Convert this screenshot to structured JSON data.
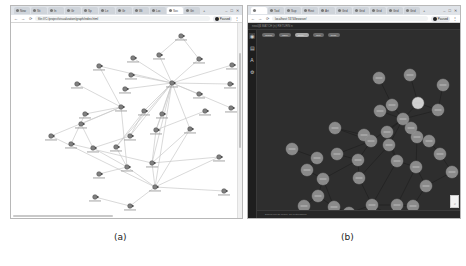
{
  "panel_a": {
    "caption": "(a)",
    "browser": {
      "tabs": [
        {
          "label": "New",
          "active": false
        },
        {
          "label": "Sti",
          "active": false
        },
        {
          "label": "In",
          "active": false
        },
        {
          "label": "Gr",
          "active": false
        },
        {
          "label": "Sp",
          "active": false
        },
        {
          "label": "Le",
          "active": false
        },
        {
          "label": "Gr",
          "active": false
        },
        {
          "label": "Wi",
          "active": false
        },
        {
          "label": "Loc",
          "active": false
        },
        {
          "label": "Soc",
          "active": true
        },
        {
          "label": "Gri",
          "active": false
        }
      ],
      "new_tab": "+",
      "window_controls": [
        "–",
        "□",
        "✕"
      ],
      "nav": {
        "back": "←",
        "forward": "→",
        "reload": "⟳"
      },
      "url": "file:///C:/project/visualization/graph/index.html",
      "profile_label": "Paused",
      "menu": "⋮"
    },
    "graph": {
      "theme": "light",
      "node_color": "#808080",
      "edge_color": "#c8c8c8",
      "nodes": [
        {
          "id": "n1",
          "x": 170,
          "y": 13
        },
        {
          "id": "n2",
          "x": 148,
          "y": 32
        },
        {
          "id": "n3",
          "x": 188,
          "y": 36
        },
        {
          "id": "n4",
          "x": 122,
          "y": 35
        },
        {
          "id": "n5",
          "x": 88,
          "y": 43
        },
        {
          "id": "n6",
          "x": 221,
          "y": 42
        },
        {
          "id": "n7",
          "x": 120,
          "y": 52
        },
        {
          "id": "n8",
          "x": 161,
          "y": 60
        },
        {
          "id": "n9",
          "x": 66,
          "y": 61
        },
        {
          "id": "n10",
          "x": 114,
          "y": 66
        },
        {
          "id": "n11",
          "x": 219,
          "y": 61
        },
        {
          "id": "n12",
          "x": 188,
          "y": 71
        },
        {
          "id": "n13",
          "x": 220,
          "y": 85
        },
        {
          "id": "n14",
          "x": 194,
          "y": 88
        },
        {
          "id": "n15",
          "x": 110,
          "y": 84
        },
        {
          "id": "n16",
          "x": 74,
          "y": 91
        },
        {
          "id": "n17",
          "x": 133,
          "y": 88
        },
        {
          "id": "n18",
          "x": 151,
          "y": 91
        },
        {
          "id": "n19",
          "x": 70,
          "y": 101
        },
        {
          "id": "n20",
          "x": 145,
          "y": 107
        },
        {
          "id": "n21",
          "x": 179,
          "y": 106
        },
        {
          "id": "n22",
          "x": 119,
          "y": 113
        },
        {
          "id": "n23",
          "x": 40,
          "y": 113
        },
        {
          "id": "n24",
          "x": 60,
          "y": 121
        },
        {
          "id": "n25",
          "x": 82,
          "y": 125
        },
        {
          "id": "n26",
          "x": 105,
          "y": 124
        },
        {
          "id": "n27",
          "x": 208,
          "y": 134
        },
        {
          "id": "n28",
          "x": 141,
          "y": 140
        },
        {
          "id": "n29",
          "x": 116,
          "y": 144
        },
        {
          "id": "n30",
          "x": 88,
          "y": 151
        },
        {
          "id": "n31",
          "x": 144,
          "y": 164
        },
        {
          "id": "n32",
          "x": 213,
          "y": 168
        },
        {
          "id": "n33",
          "x": 84,
          "y": 174
        },
        {
          "id": "n34",
          "x": 119,
          "y": 183
        }
      ],
      "edges": [
        [
          "n1",
          "n2"
        ],
        [
          "n1",
          "n3"
        ],
        [
          "n2",
          "n8"
        ],
        [
          "n3",
          "n8"
        ],
        [
          "n4",
          "n8"
        ],
        [
          "n5",
          "n15"
        ],
        [
          "n5",
          "n8"
        ],
        [
          "n6",
          "n8"
        ],
        [
          "n7",
          "n8"
        ],
        [
          "n8",
          "n11"
        ],
        [
          "n8",
          "n12"
        ],
        [
          "n8",
          "n13"
        ],
        [
          "n9",
          "n15"
        ],
        [
          "n10",
          "n8"
        ],
        [
          "n8",
          "n17"
        ],
        [
          "n8",
          "n18"
        ],
        [
          "n8",
          "n20"
        ],
        [
          "n8",
          "n21"
        ],
        [
          "n8",
          "n22"
        ],
        [
          "n8",
          "n28"
        ],
        [
          "n8",
          "n26"
        ],
        [
          "n8",
          "n31"
        ],
        [
          "n15",
          "n16"
        ],
        [
          "n15",
          "n19"
        ],
        [
          "n15",
          "n23"
        ],
        [
          "n15",
          "n29"
        ],
        [
          "n16",
          "n24"
        ],
        [
          "n19",
          "n25"
        ],
        [
          "n17",
          "n26"
        ],
        [
          "n17",
          "n22"
        ],
        [
          "n18",
          "n20"
        ],
        [
          "n20",
          "n28"
        ],
        [
          "n21",
          "n28"
        ],
        [
          "n21",
          "n31"
        ],
        [
          "n20",
          "n14"
        ],
        [
          "n22",
          "n25"
        ],
        [
          "n24",
          "n28"
        ],
        [
          "n25",
          "n29"
        ],
        [
          "n26",
          "n29"
        ],
        [
          "n28",
          "n27"
        ],
        [
          "n29",
          "n31"
        ],
        [
          "n31",
          "n27"
        ],
        [
          "n31",
          "n32"
        ],
        [
          "n33",
          "n34"
        ],
        [
          "n34",
          "n31"
        ],
        [
          "n29",
          "n30"
        ],
        [
          "n28",
          "n31"
        ],
        [
          "n23",
          "n31"
        ]
      ]
    }
  },
  "panel_b": {
    "caption": "(b)",
    "browser": {
      "tabs": [
        {
          "label": "",
          "active": true
        },
        {
          "label": "Tool",
          "active": false
        },
        {
          "label": "Sup",
          "active": false
        },
        {
          "label": "Rest",
          "active": false
        },
        {
          "label": "Art",
          "active": false
        },
        {
          "label": "Grid",
          "active": false
        },
        {
          "label": "Grid",
          "active": false
        },
        {
          "label": "Grid",
          "active": false
        },
        {
          "label": "Grid",
          "active": false
        },
        {
          "label": "Grid",
          "active": false
        }
      ],
      "new_tab": "+",
      "window_controls": [
        "–",
        "□",
        "✕"
      ],
      "nav": {
        "back": "←",
        "forward": "→",
        "reload": "⟳"
      },
      "url": "localhost:7474/browser/",
      "profile_label": "Paused",
      "menu": "⋮"
    },
    "app": {
      "topbar_text": "neo4j$ MATCH (n) RETURN n",
      "sidebar_icons": [
        {
          "name": "database-icon",
          "glyph": "◉",
          "active": true
        },
        {
          "name": "favorites-icon",
          "glyph": "▤",
          "active": false
        },
        {
          "name": "docs-icon",
          "glyph": "A",
          "active": false
        },
        {
          "name": "settings-icon",
          "glyph": "⚙",
          "active": false
        }
      ],
      "chips": [
        {
          "label": "Graph",
          "selected": false
        },
        {
          "label": "Table",
          "selected": false
        },
        {
          "label": "Entity",
          "selected": true
        },
        {
          "label": "Text",
          "selected": false
        },
        {
          "label": "Code",
          "selected": false
        }
      ],
      "status_text": "Displaying 38 nodes, 53 relationships",
      "zoom_glyph": "⌕"
    },
    "graph": {
      "theme": "dark",
      "background": "#2e2e2e",
      "node_color": "#8a8a8a",
      "highlight_node_color": "#d0d0d0",
      "edge_color": "#1a1a1a",
      "nodes": [
        {
          "id": "m1",
          "x": 122,
          "y": 37,
          "hl": false
        },
        {
          "id": "m2",
          "x": 153,
          "y": 34,
          "hl": false
        },
        {
          "id": "m3",
          "x": 186,
          "y": 44,
          "hl": false
        },
        {
          "id": "m4",
          "x": 135,
          "y": 64,
          "hl": false
        },
        {
          "id": "m5",
          "x": 161,
          "y": 62,
          "hl": true
        },
        {
          "id": "m6",
          "x": 181,
          "y": 69,
          "hl": false
        },
        {
          "id": "m7",
          "x": 123,
          "y": 70,
          "hl": false
        },
        {
          "id": "m8",
          "x": 146,
          "y": 78,
          "hl": false
        },
        {
          "id": "m9",
          "x": 78,
          "y": 87,
          "hl": false
        },
        {
          "id": "m10",
          "x": 160,
          "y": 96,
          "hl": false
        },
        {
          "id": "m11",
          "x": 107,
          "y": 94,
          "hl": false
        },
        {
          "id": "m12",
          "x": 130,
          "y": 91,
          "hl": false
        },
        {
          "id": "m13",
          "x": 154,
          "y": 87,
          "hl": false
        },
        {
          "id": "m14",
          "x": 35,
          "y": 108,
          "hl": false
        },
        {
          "id": "m15",
          "x": 114,
          "y": 100,
          "hl": false
        },
        {
          "id": "m16",
          "x": 132,
          "y": 104,
          "hl": false
        },
        {
          "id": "m17",
          "x": 172,
          "y": 100,
          "hl": false
        },
        {
          "id": "m18",
          "x": 60,
          "y": 117,
          "hl": false
        },
        {
          "id": "m19",
          "x": 80,
          "y": 113,
          "hl": false
        },
        {
          "id": "m20",
          "x": 101,
          "y": 119,
          "hl": false
        },
        {
          "id": "m21",
          "x": 140,
          "y": 120,
          "hl": false
        },
        {
          "id": "m22",
          "x": 183,
          "y": 113,
          "hl": false
        },
        {
          "id": "m23",
          "x": 50,
          "y": 129,
          "hl": false
        },
        {
          "id": "m24",
          "x": 66,
          "y": 138,
          "hl": false
        },
        {
          "id": "m25",
          "x": 102,
          "y": 137,
          "hl": false
        },
        {
          "id": "m26",
          "x": 159,
          "y": 126,
          "hl": false
        },
        {
          "id": "m27",
          "x": 195,
          "y": 131,
          "hl": false
        },
        {
          "id": "m28",
          "x": 169,
          "y": 145,
          "hl": false
        },
        {
          "id": "m29",
          "x": 61,
          "y": 155,
          "hl": false
        },
        {
          "id": "m30",
          "x": 47,
          "y": 165,
          "hl": false
        },
        {
          "id": "m31",
          "x": 77,
          "y": 166,
          "hl": false
        },
        {
          "id": "m32",
          "x": 92,
          "y": 172,
          "hl": false
        },
        {
          "id": "m33",
          "x": 115,
          "y": 164,
          "hl": false
        },
        {
          "id": "m34",
          "x": 135,
          "y": 176,
          "hl": false
        },
        {
          "id": "m35",
          "x": 140,
          "y": 164,
          "hl": false
        },
        {
          "id": "m36",
          "x": 156,
          "y": 165,
          "hl": false
        },
        {
          "id": "m37",
          "x": 152,
          "y": 181,
          "hl": false
        },
        {
          "id": "m38",
          "x": 28,
          "y": 182,
          "hl": false
        }
      ],
      "edges": [
        [
          "m1",
          "m4"
        ],
        [
          "m2",
          "m5"
        ],
        [
          "m3",
          "m6"
        ],
        [
          "m4",
          "m8"
        ],
        [
          "m5",
          "m8"
        ],
        [
          "m6",
          "m8"
        ],
        [
          "m7",
          "m8"
        ],
        [
          "m8",
          "m10"
        ],
        [
          "m8",
          "m12"
        ],
        [
          "m8",
          "m13"
        ],
        [
          "m8",
          "m15"
        ],
        [
          "m8",
          "m16"
        ],
        [
          "m9",
          "m15"
        ],
        [
          "m11",
          "m15"
        ],
        [
          "m12",
          "m16"
        ],
        [
          "m13",
          "m17"
        ],
        [
          "m15",
          "m20"
        ],
        [
          "m16",
          "m21"
        ],
        [
          "m17",
          "m22"
        ],
        [
          "m10",
          "m26"
        ],
        [
          "m14",
          "m18"
        ],
        [
          "m18",
          "m23"
        ],
        [
          "m19",
          "m20"
        ],
        [
          "m20",
          "m25"
        ],
        [
          "m21",
          "m26"
        ],
        [
          "m22",
          "m27"
        ],
        [
          "m23",
          "m24"
        ],
        [
          "m24",
          "m29"
        ],
        [
          "m25",
          "m33"
        ],
        [
          "m26",
          "m28"
        ],
        [
          "m28",
          "m36"
        ],
        [
          "m29",
          "m30"
        ],
        [
          "m29",
          "m31"
        ],
        [
          "m31",
          "m32"
        ],
        [
          "m33",
          "m34"
        ],
        [
          "m33",
          "m35"
        ],
        [
          "m35",
          "m36"
        ],
        [
          "m36",
          "m37"
        ],
        [
          "m30",
          "m38"
        ],
        [
          "m16",
          "m25"
        ],
        [
          "m21",
          "m33"
        ],
        [
          "m10",
          "m17"
        ],
        [
          "m12",
          "m21"
        ],
        [
          "m15",
          "m19"
        ],
        [
          "m24",
          "m31"
        ],
        [
          "m27",
          "m28"
        ],
        [
          "m4",
          "m7"
        ],
        [
          "m5",
          "m6"
        ],
        [
          "m13",
          "m10"
        ],
        [
          "m20",
          "m24"
        ],
        [
          "m32",
          "m33"
        ],
        [
          "m11",
          "m9"
        ],
        [
          "m26",
          "m35"
        ]
      ]
    }
  }
}
